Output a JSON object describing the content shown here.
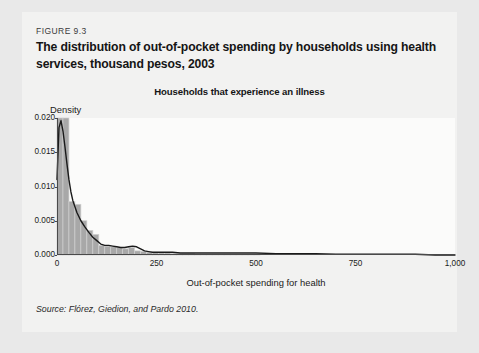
{
  "figure": {
    "label": "FIGURE 9.3",
    "title": "The distribution of out-of-pocket spending by households using health services, thousand pesos, 2003",
    "source": "Source: Flórez, Giedion, and Pardo 2010."
  },
  "colors": {
    "page_background": "#e9e9e9",
    "card_background": "#f2f2f1",
    "plot_background": "#fbfbfa",
    "bar_fill": "#a8a8a8",
    "bar_edge": "#cfcfcf",
    "curve": "#1a1a1a",
    "axis": "#4a4a4a",
    "text": "#151515"
  },
  "chart_data": {
    "type": "bar",
    "title": "Households that experience an illness",
    "xlabel": "Out-of-pocket spending for health",
    "ylabel": "Density",
    "xlim": [
      0,
      1000
    ],
    "ylim": [
      0,
      0.02
    ],
    "grid": false,
    "legend": false,
    "xticks": [
      0,
      250,
      500,
      750,
      1000
    ],
    "xtick_labels": [
      "0",
      "250",
      "500",
      "750",
      "1,000"
    ],
    "yticks": [
      0.0,
      0.005,
      0.01,
      0.015,
      0.02
    ],
    "ytick_labels": [
      "0.000",
      "0.005",
      "0.010",
      "0.015",
      "0.020"
    ],
    "bin_width": 15,
    "bin_starts": [
      0,
      15,
      30,
      45,
      60,
      75,
      90,
      105,
      120,
      135,
      150,
      165,
      180,
      195,
      210,
      225,
      240,
      255,
      270,
      285,
      300,
      315,
      330,
      345,
      360,
      375,
      390,
      405,
      420,
      435,
      450,
      465,
      480,
      495
    ],
    "values": [
      0.02,
      0.02,
      0.0078,
      0.0074,
      0.005,
      0.0036,
      0.003,
      0.0014,
      0.0013,
      0.0012,
      0.0011,
      0.0009,
      0.0011,
      0.0006,
      0.0005,
      0.0004,
      0.0004,
      0.0003,
      0.0003,
      0.0002,
      0.0002,
      0.0002,
      0.0002,
      0.0001,
      0.0001,
      0.0001,
      0.0001,
      0.0001,
      0.0001,
      0.0001,
      0.0001,
      0.0001,
      0.0001,
      0.0001
    ],
    "density_curve": {
      "name": "kernel density estimate",
      "x": [
        0,
        5,
        10,
        15,
        20,
        25,
        30,
        35,
        40,
        50,
        60,
        70,
        80,
        90,
        100,
        110,
        120,
        130,
        140,
        150,
        160,
        170,
        180,
        190,
        200,
        210,
        220,
        230,
        240,
        250,
        270,
        290,
        310,
        330,
        350,
        375,
        400,
        425,
        450,
        475,
        500,
        550,
        600,
        650,
        700,
        750,
        800,
        850,
        900,
        950,
        1000
      ],
      "y": [
        0.011,
        0.0186,
        0.0196,
        0.0181,
        0.0158,
        0.0133,
        0.011,
        0.0092,
        0.0079,
        0.0062,
        0.005,
        0.0041,
        0.0033,
        0.0026,
        0.0021,
        0.0016,
        0.0014,
        0.0014,
        0.0013,
        0.0012,
        0.0011,
        0.0011,
        0.0012,
        0.0013,
        0.0012,
        0.0009,
        0.0006,
        0.0005,
        0.0004,
        0.0004,
        0.0004,
        0.0004,
        0.0003,
        0.0003,
        0.0003,
        0.0003,
        0.0003,
        0.0003,
        0.0003,
        0.0003,
        0.0003,
        0.0002,
        0.0002,
        0.0002,
        0.0001,
        0.0001,
        0.0001,
        0.0001,
        0.0001,
        0.0,
        0.0
      ]
    }
  }
}
